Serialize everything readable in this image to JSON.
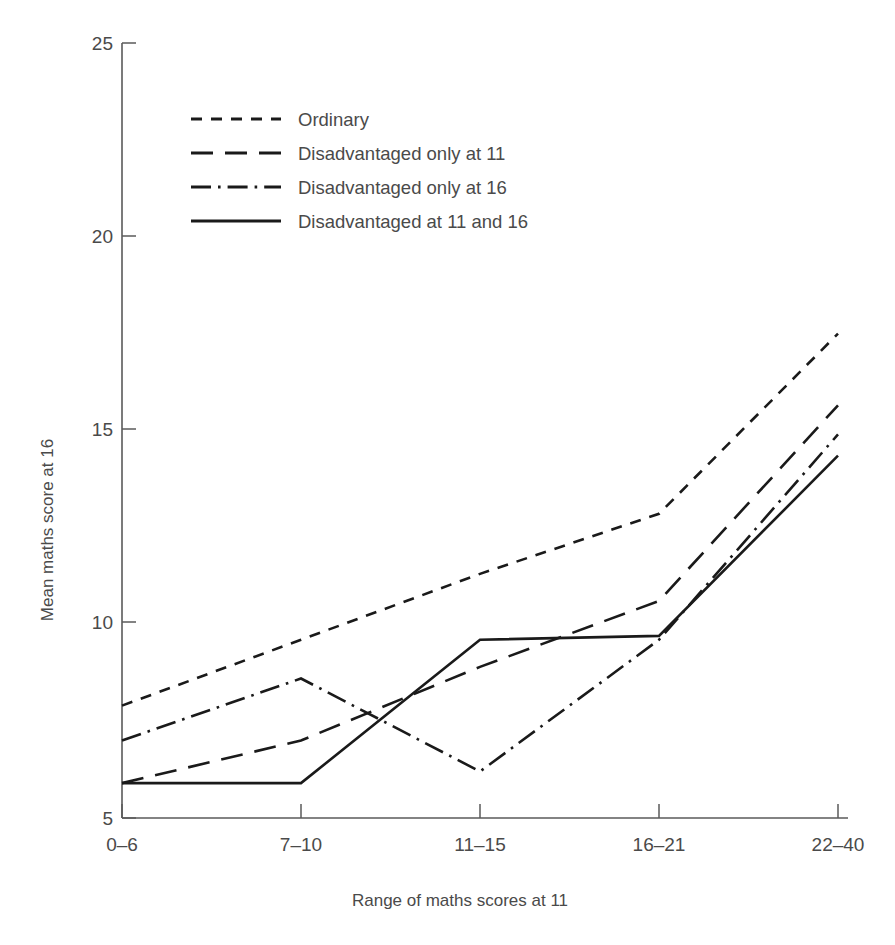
{
  "chart_data": {
    "type": "line",
    "title": "",
    "xlabel": "Range of maths scores at 11",
    "ylabel": "Mean maths score at 16",
    "categories": [
      "0–6",
      "7–10",
      "11–15",
      "16–21",
      "22–40"
    ],
    "ylim": [
      5,
      25
    ],
    "yticks": [
      5,
      10,
      15,
      20,
      25
    ],
    "ytick_labels": [
      "5",
      "10",
      "15",
      "20",
      "25"
    ],
    "grid": false,
    "legend_position": "upper-left-inside",
    "series": [
      {
        "name": "Ordinary",
        "style": "short-dashed",
        "dasharray": "11,9",
        "values": [
          7.9,
          9.6,
          11.3,
          12.85,
          17.5
        ]
      },
      {
        "name": "Disadvantaged only at 11",
        "style": "long-dashed",
        "dasharray": "22,12",
        "values": [
          5.9,
          7.0,
          8.9,
          10.6,
          15.65
        ]
      },
      {
        "name": "Disadvantaged only at 16",
        "style": "dash-dot",
        "dasharray": "20,7,2.6,7",
        "values": [
          7.0,
          8.6,
          6.2,
          9.6,
          14.9
        ]
      },
      {
        "name": "Disadvantaged at 11 and 16",
        "style": "solid",
        "dasharray": "none",
        "values": [
          5.9,
          5.9,
          9.6,
          9.7,
          14.35
        ]
      }
    ]
  },
  "legend": {
    "items": [
      "Ordinary",
      "Disadvantaged only at 11",
      "Disadvantaged only at 16",
      "Disadvantaged at 11 and 16"
    ]
  }
}
